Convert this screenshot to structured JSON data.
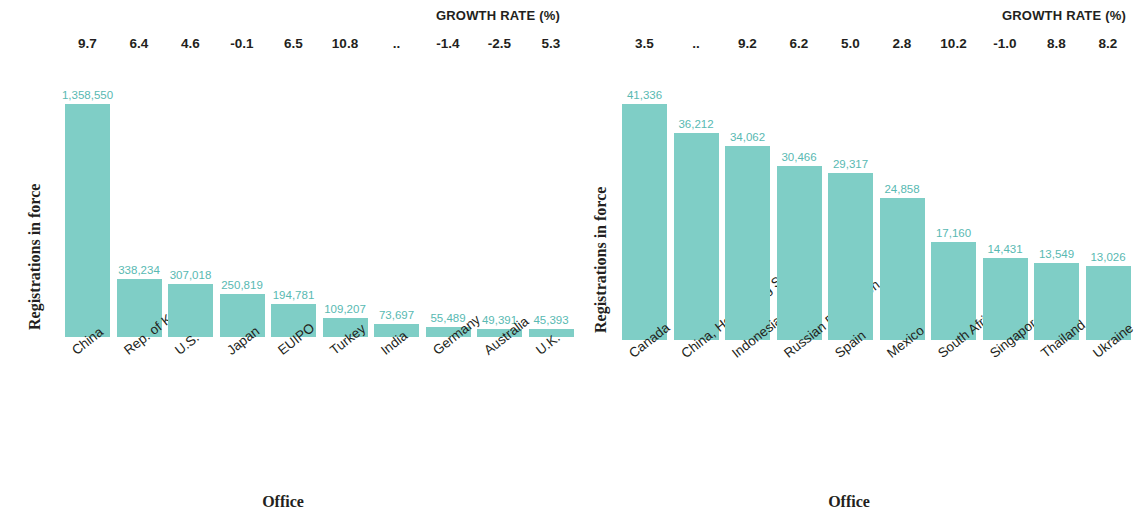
{
  "figure": {
    "bar_color": "#7fcec6",
    "value_label_color": "#58b9b2",
    "text_color": "#231f20"
  },
  "panels": [
    {
      "id": "left",
      "growth_title": "GROWTH RATE (%)",
      "ylabel": "Registrations in force",
      "xlabel": "Office",
      "categories": [
        "China",
        "Rep. of Korea",
        "U.S.",
        "Japan",
        "EUIPO",
        "Turkey",
        "India",
        "Germany",
        "Australia",
        "U.K."
      ],
      "values": [
        1358550,
        338234,
        307018,
        250819,
        194781,
        109207,
        73697,
        55489,
        49391,
        45393
      ],
      "value_labels": [
        "1,358,550",
        "338,234",
        "307,018",
        "250,819",
        "194,781",
        "109,207",
        "73,697",
        "55,489",
        "49,391",
        "45,393"
      ],
      "growth_rates": [
        "9.7",
        "6.4",
        "4.6",
        "-0.1",
        "6.5",
        "10.8",
        "..",
        "-1.4",
        "-2.5",
        "5.3"
      ]
    },
    {
      "id": "right",
      "growth_title": "GROWTH RATE (%)",
      "ylabel": "Registrations in force",
      "xlabel": "Office",
      "categories": [
        "Canada",
        "China, Hong Kong SAR",
        "Indonesia",
        "Russian Federation",
        "Spain",
        "Mexico",
        "South Africa",
        "Singapore",
        "Thailand",
        "Ukraine"
      ],
      "category_superscripts": [
        "",
        "*",
        "",
        "",
        "",
        "",
        "",
        "",
        "",
        ""
      ],
      "values": [
        41336,
        36212,
        34062,
        30466,
        29317,
        24858,
        17160,
        14431,
        13549,
        13026
      ],
      "value_labels": [
        "41,336",
        "36,212",
        "34,062",
        "30,466",
        "29,317",
        "24,858",
        "17,160",
        "14,431",
        "13,549",
        "13,026"
      ],
      "growth_rates": [
        "3.5",
        "..",
        "9.2",
        "6.2",
        "5.0",
        "2.8",
        "10.2",
        "-1.0",
        "8.8",
        "8.2"
      ]
    }
  ],
  "chart_data": [
    {
      "type": "bar",
      "title": "",
      "xlabel": "Office",
      "ylabel": "Registrations in force",
      "categories": [
        "China",
        "Rep. of Korea",
        "U.S.",
        "Japan",
        "EUIPO",
        "Turkey",
        "India",
        "Germany",
        "Australia",
        "U.K."
      ],
      "values": [
        1358550,
        338234,
        307018,
        250819,
        194781,
        109207,
        73697,
        55489,
        49391,
        45393
      ],
      "annotations": {
        "GROWTH RATE (%)": [
          "9.7",
          "6.4",
          "4.6",
          "-0.1",
          "6.5",
          "10.8",
          "..",
          "-1.4",
          "-2.5",
          "5.3"
        ]
      },
      "ylim": [
        0,
        1358550
      ],
      "grid": false,
      "legend": "none"
    },
    {
      "type": "bar",
      "title": "",
      "xlabel": "Office",
      "ylabel": "Registrations in force",
      "categories": [
        "Canada",
        "China, Hong Kong SAR",
        "Indonesia",
        "Russian Federation",
        "Spain",
        "Mexico",
        "South Africa",
        "Singapore",
        "Thailand",
        "Ukraine"
      ],
      "values": [
        41336,
        36212,
        34062,
        30466,
        29317,
        24858,
        17160,
        14431,
        13549,
        13026
      ],
      "annotations": {
        "GROWTH RATE (%)": [
          "3.5",
          "..",
          "9.2",
          "6.2",
          "5.0",
          "2.8",
          "10.2",
          "-1.0",
          "8.8",
          "8.2"
        ]
      },
      "ylim": [
        0,
        41336
      ],
      "grid": false,
      "legend": "none"
    }
  ]
}
